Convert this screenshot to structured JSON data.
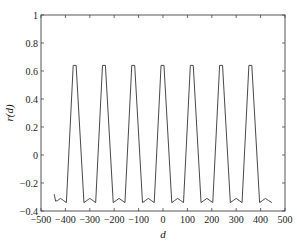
{
  "chart_data": {
    "type": "line",
    "title": "",
    "xlabel": "d",
    "ylabel": "r(d)",
    "xlim": [
      -500,
      500
    ],
    "ylim": [
      -0.4,
      1
    ],
    "grid": false,
    "legend": null,
    "xticks": [
      -500,
      -400,
      -300,
      -200,
      -100,
      0,
      100,
      200,
      300,
      400,
      500
    ],
    "xtick_labels": [
      "−500",
      "−400",
      "−300",
      "−200",
      "−100",
      "0",
      "100",
      "200",
      "300",
      "400",
      "500"
    ],
    "yticks": [
      -0.4,
      -0.2,
      0,
      0.2,
      0.4,
      0.6,
      0.8,
      1
    ],
    "ytick_labels": [
      "−0.4",
      "−0.2",
      "0",
      "0.2",
      "0.4",
      "0.6",
      "0.8",
      "1"
    ],
    "series": [
      {
        "name": "r(d)",
        "color": "#333333",
        "x": [
          -446,
          -440,
          -432,
          -420,
          -408,
          -396,
          -368,
          -356,
          -324,
          -312,
          -300,
          -288,
          -276,
          -248,
          -236,
          -204,
          -192,
          -180,
          -168,
          -156,
          -128,
          -116,
          -84,
          -72,
          -60,
          -48,
          -36,
          -8,
          4,
          36,
          48,
          60,
          72,
          84,
          112,
          124,
          156,
          168,
          180,
          192,
          204,
          232,
          244,
          276,
          288,
          300,
          312,
          324,
          352,
          364,
          396,
          408,
          420,
          432,
          446
        ],
        "y": [
          -0.28,
          -0.33,
          -0.325,
          -0.31,
          -0.325,
          -0.34,
          0.64,
          0.64,
          -0.34,
          -0.325,
          -0.31,
          -0.325,
          -0.34,
          0.64,
          0.64,
          -0.34,
          -0.325,
          -0.31,
          -0.325,
          -0.34,
          0.64,
          0.64,
          -0.34,
          -0.325,
          -0.31,
          -0.325,
          -0.34,
          0.64,
          0.64,
          -0.34,
          -0.325,
          -0.31,
          -0.325,
          -0.34,
          0.64,
          0.64,
          -0.34,
          -0.325,
          -0.31,
          -0.325,
          -0.34,
          0.64,
          0.64,
          -0.34,
          -0.325,
          -0.31,
          -0.325,
          -0.34,
          0.64,
          0.64,
          -0.34,
          -0.325,
          -0.31,
          -0.325,
          -0.34
        ]
      }
    ],
    "peaks_at": [
      -360,
      -240,
      -120,
      0,
      120,
      240,
      360
    ],
    "peak_value": 0.64,
    "trough_value": -0.34
  },
  "layout": {
    "plot_left": 41,
    "plot_right": 285,
    "plot_top": 15,
    "plot_bottom": 211
  }
}
